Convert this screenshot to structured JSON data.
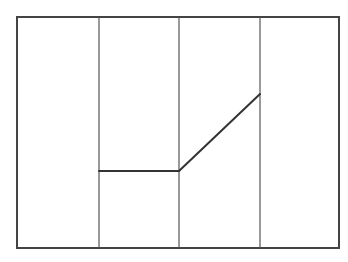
{
  "diagram": {
    "width": 348,
    "height": 262,
    "background": "#ffffff",
    "frame": {
      "x": 17,
      "y": 17,
      "width": 322,
      "height": 231,
      "stroke": "#444444",
      "stroke_width": 2
    },
    "dividers": [
      {
        "x": 99,
        "y1": 17,
        "y2": 248,
        "stroke": "#555555",
        "stroke_width": 1.2
      },
      {
        "x": 179,
        "y1": 17,
        "y2": 248,
        "stroke": "#555555",
        "stroke_width": 1.2
      },
      {
        "x": 260,
        "y1": 17,
        "y2": 248,
        "stroke": "#555555",
        "stroke_width": 1.2
      }
    ],
    "polyline": {
      "points": [
        [
          99,
          171
        ],
        [
          179,
          171
        ],
        [
          260,
          94
        ]
      ],
      "stroke": "#333333",
      "stroke_width": 2
    }
  }
}
